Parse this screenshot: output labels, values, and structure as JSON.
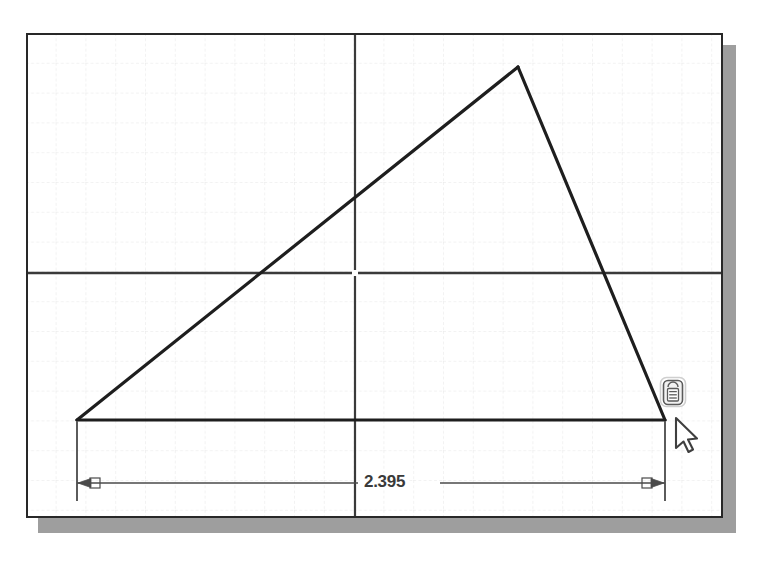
{
  "app": {
    "title": "Sketch Graphics Window",
    "background_color": "#ffffff",
    "frame_border_color": "#282828",
    "shadow_color": "#9e9e9e"
  },
  "grid": {
    "spacing_px": 29.8,
    "line_color": "#e8e8e8",
    "style": "dashed",
    "visible": true
  },
  "axes": {
    "color": "#3a3a3a",
    "origin_label": "origin",
    "horizontal_axis_y": 273,
    "vertical_axis_x": 355
  },
  "sketch": {
    "name": "triangle-profile",
    "line_color": "#1e1e1e",
    "line_width": 3,
    "vertices": [
      {
        "name": "bottom-left",
        "x": 77,
        "y": 420
      },
      {
        "name": "apex",
        "x": 518,
        "y": 67
      },
      {
        "name": "bottom-right",
        "x": 665,
        "y": 420
      }
    ]
  },
  "dimension": {
    "name": "horizontal-base-dimension",
    "value": "2.395",
    "units": "in",
    "color": "#4a4a4a",
    "dimension_line_y": 483,
    "extension_left_x": 77,
    "extension_right_x": 665,
    "arrow_style": "filled-outward",
    "text_x": 380,
    "text_y": 474
  },
  "cursor": {
    "name": "dimension-tool-cursor",
    "x": 678,
    "y": 419,
    "badge_icon": "dimension-badge-icon",
    "pointer_icon": "arrow-pointer-icon"
  }
}
